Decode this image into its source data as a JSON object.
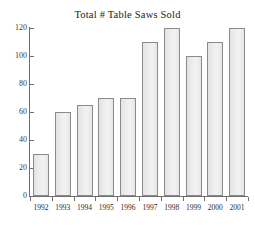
{
  "chart_data": {
    "type": "bar",
    "title": "Total # Table Saws Sold",
    "xlabel": "",
    "ylabel": "",
    "categories": [
      "1992",
      "1993",
      "1994",
      "1995",
      "1996",
      "1997",
      "1998",
      "1999",
      "2000",
      "2001"
    ],
    "values": [
      30,
      60,
      65,
      70,
      70,
      110,
      120,
      100,
      110,
      120
    ],
    "ylim": [
      0,
      120
    ],
    "yticks": [
      0,
      20,
      40,
      60,
      80,
      100,
      120
    ],
    "ytick_labels": [
      "0",
      "20",
      "40",
      "60",
      "80",
      "100",
      "120"
    ],
    "grid": false,
    "legend": null,
    "series": [
      {
        "name": "Table Saws Sold",
        "values": [
          30,
          60,
          65,
          70,
          70,
          110,
          120,
          100,
          110,
          120
        ]
      }
    ]
  },
  "style": {
    "bar_fill": "#e9e9e9",
    "bar_border": "#8a8a8a",
    "axis_color": "#6f6f6f",
    "text_color": "#222222",
    "background": "#ffffff"
  }
}
